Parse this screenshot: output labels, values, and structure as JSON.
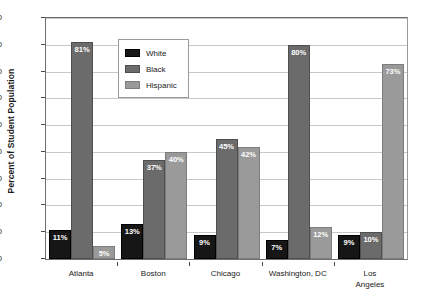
{
  "chart_data": {
    "type": "bar",
    "title": "",
    "xlabel": "",
    "ylabel": "Percent of Student Population",
    "ylim": [
      0,
      90
    ],
    "ytick_step": 10,
    "yticks": [
      0,
      10,
      20,
      30,
      40,
      50,
      60,
      70,
      80,
      90
    ],
    "grid": true,
    "legend_position": "top-center-inside",
    "value_suffix": "%",
    "categories": [
      "Atlanta",
      "Boston",
      "Chicago",
      "Washington, DC",
      "Los Angeles"
    ],
    "category_lines": [
      [
        "Atlanta"
      ],
      [
        "Boston"
      ],
      [
        "Chicago"
      ],
      [
        "Washington, DC"
      ],
      [
        "Los",
        "Angeles"
      ]
    ],
    "series": [
      {
        "name": "White",
        "color": "#161616",
        "values": [
          11,
          13,
          9,
          7,
          9
        ],
        "labels": [
          "11%",
          "13%",
          "9%",
          "7%",
          "9%"
        ]
      },
      {
        "name": "Black",
        "color": "#6b6b6b",
        "values": [
          81,
          37,
          45,
          80,
          10
        ],
        "labels": [
          "81%",
          "37%",
          "45%",
          "80%",
          "10%"
        ]
      },
      {
        "name": "Hispanic",
        "color": "#9a9a9a",
        "values": [
          5,
          40,
          42,
          12,
          73
        ],
        "labels": [
          "5%",
          "40%",
          "42%",
          "12%",
          "73%"
        ]
      }
    ]
  },
  "legend": {
    "items": [
      {
        "label": "White",
        "swatch": "white"
      },
      {
        "label": "Black",
        "swatch": "black"
      },
      {
        "label": "Hispanic",
        "swatch": "hispanic"
      }
    ]
  }
}
